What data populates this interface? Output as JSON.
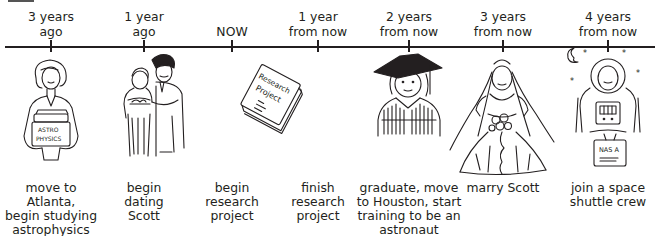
{
  "timeline": {
    "axis": {
      "x_start": 5,
      "x_end": 655,
      "y": 46
    },
    "events": [
      {
        "id": "e1",
        "time_label": "3 years\nago",
        "time_line1": "3 years",
        "time_line2": "ago",
        "x": 51,
        "description": "move to\nAtlanta,\nbegin studying\nastrophysics",
        "illustration": "woman-holding-astrophysics-books",
        "book_text": "ASTRO PHYSICS"
      },
      {
        "id": "e2",
        "time_label": "1 year\nago",
        "time_line1": "1 year",
        "time_line2": "ago",
        "x": 144,
        "description": "begin\ndating\nScott",
        "illustration": "couple-embracing"
      },
      {
        "id": "e3",
        "time_label": "NOW",
        "time_line1": "",
        "time_line2": "NOW",
        "x": 232,
        "description": "begin\nresearch\nproject",
        "illustration": "research-project-report",
        "report_text_1": "Research",
        "report_text_2": "Project"
      },
      {
        "id": "e4",
        "time_label": "1 year\nfrom now",
        "time_line1": "1 year",
        "time_line2": "from now",
        "x": 318,
        "description": "finish\nresearch\nproject",
        "illustration": "none"
      },
      {
        "id": "e5",
        "time_label": "2 years\nfrom now",
        "time_line1": "2 years",
        "time_line2": "from now",
        "x": 409,
        "description": "graduate, move\nto Houston, start\ntraining to be an\nastronaut",
        "illustration": "graduate-in-cap-and-gown"
      },
      {
        "id": "e6",
        "time_label": "3 years\nfrom now",
        "time_line1": "3 years",
        "time_line2": "from now",
        "x": 503,
        "description": "marry Scott",
        "illustration": "bride-in-wedding-dress"
      },
      {
        "id": "e7",
        "time_label": "4 years\nfrom now",
        "time_line1": "4 years",
        "time_line2": "from now",
        "x": 608,
        "description": "join a space\nshuttle crew",
        "illustration": "astronaut-in-spacesuit",
        "case_text": "NAS A"
      }
    ]
  }
}
